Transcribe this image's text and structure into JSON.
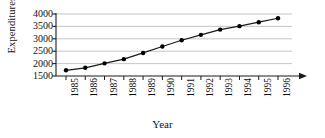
{
  "chart_data": {
    "type": "line",
    "title": "",
    "xlabel": "Year",
    "ylabel": "Expenditures ($)",
    "categories": [
      "1985",
      "1986",
      "1987",
      "1988",
      "1989",
      "1990",
      "1991",
      "1992",
      "1993",
      "1994",
      "1995",
      "1996"
    ],
    "values": [
      1730,
      1830,
      2010,
      2180,
      2430,
      2690,
      2940,
      3160,
      3370,
      3510,
      3670,
      3830
    ],
    "ylim": [
      1500,
      4000
    ],
    "yticks": [
      1500,
      2000,
      2500,
      3000,
      3500,
      4000
    ],
    "ytick_labels": [
      "1500",
      "2000",
      "2500",
      "3000",
      "3500",
      "4000"
    ],
    "grid": "horizontal",
    "legend": "none",
    "marker": "filled-circle",
    "line_color": "#1a1a1a",
    "marker_color": "#000000",
    "grid_color": "#b8b8b8",
    "axis_color": "#1a1a1a",
    "x_axis_arrow": true
  },
  "axes": {
    "y_title": "Expenditures ($)",
    "x_title": "Year"
  }
}
